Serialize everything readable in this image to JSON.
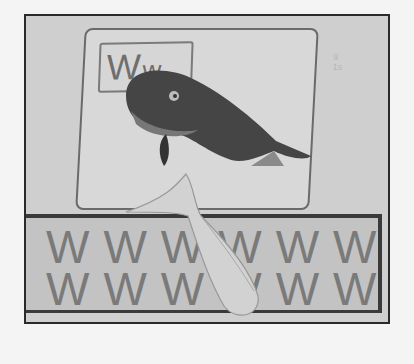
{
  "image": {
    "description": "Grayscale photo of an augmented-reality alphabet card for letter W with 3D whale models",
    "card": {
      "letter_label": "W",
      "letter_label_small": "w",
      "faint_text": "9 1s"
    },
    "practice_rows": [
      "WWWWWWW",
      "WWWWWWW"
    ],
    "colors": {
      "background": "#f4f4f4",
      "photo_frame": "#2a2a2a",
      "whale_dark": "#3e3e3e",
      "whale_light": "#cbcbcb"
    }
  }
}
